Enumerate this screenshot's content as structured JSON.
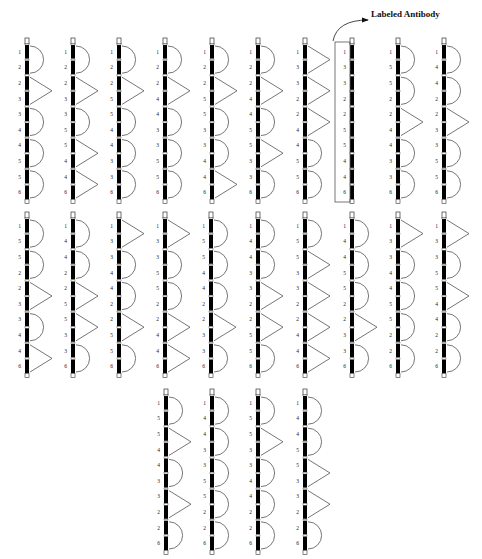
{
  "annotation": {
    "label": "Labeled Antibody",
    "x": 371,
    "y": 15,
    "arrow_from": [
      333,
      41
    ],
    "arrow_to": [
      368,
      20
    ]
  },
  "style": {
    "strip_color": "#000000",
    "strip_border": "#333333",
    "shape_color": "#666666",
    "text_color": "#222222",
    "bracket_color": "#555555"
  },
  "geometry": {
    "segment_height": 15.6,
    "cap_height": 6,
    "strip_width": 4,
    "arc_radius_factor": 1.0,
    "tri_width": 22
  },
  "rows": [
    {
      "top": 38,
      "strips": [
        {
          "x": 27,
          "numbers": [
            1,
            2,
            2,
            3,
            3,
            4,
            4,
            5,
            5,
            6
          ],
          "domains": [
            "arc",
            "tri",
            "arc",
            "arc",
            "arc"
          ]
        },
        {
          "x": 73,
          "numbers": [
            1,
            2,
            2,
            3,
            3,
            5,
            5,
            4,
            4,
            6
          ],
          "domains": [
            "arc",
            "tri",
            "arc",
            "tri",
            "tri"
          ]
        },
        {
          "x": 119,
          "numbers": [
            1,
            2,
            2,
            5,
            5,
            4,
            4,
            3,
            3,
            6
          ],
          "domains": [
            "arc",
            "tri",
            "arc",
            "arc",
            "arc"
          ]
        },
        {
          "x": 165,
          "numbers": [
            1,
            2,
            2,
            4,
            4,
            3,
            3,
            5,
            5,
            6
          ],
          "domains": [
            "arc",
            "tri",
            "arc",
            "arc",
            "arc"
          ]
        },
        {
          "x": 212,
          "numbers": [
            1,
            2,
            2,
            5,
            5,
            3,
            3,
            4,
            4,
            6
          ],
          "domains": [
            "arc",
            "tri",
            "arc",
            "arc",
            "tri"
          ]
        },
        {
          "x": 258,
          "numbers": [
            1,
            2,
            2,
            4,
            4,
            5,
            5,
            3,
            3,
            6
          ],
          "domains": [
            "arc",
            "tri",
            "arc",
            "tri",
            "arc"
          ]
        },
        {
          "x": 305,
          "numbers": [
            1,
            3,
            3,
            2,
            2,
            4,
            4,
            5,
            5,
            6
          ],
          "domains": [
            "tri",
            "tri",
            "tri",
            "arc",
            "arc"
          ]
        },
        {
          "x": 352,
          "numbers": [
            1,
            3,
            3,
            2,
            2,
            5,
            5,
            4,
            4,
            6
          ],
          "domains": [],
          "labeled": true
        },
        {
          "x": 398,
          "numbers": [
            1,
            5,
            5,
            2,
            2,
            4,
            4,
            3,
            3,
            6
          ],
          "domains": [
            "arc",
            "arc",
            "tri",
            "arc",
            "arc"
          ]
        },
        {
          "x": 444,
          "numbers": [
            1,
            4,
            4,
            2,
            2,
            3,
            3,
            5,
            5,
            6
          ],
          "domains": [
            "arc",
            "arc",
            "tri",
            "arc",
            "arc"
          ]
        }
      ]
    },
    {
      "top": 212,
      "strips": [
        {
          "x": 27,
          "numbers": [
            1,
            5,
            5,
            2,
            2,
            3,
            3,
            4,
            4,
            6
          ],
          "domains": [
            "arc",
            "arc",
            "tri",
            "arc",
            "tri"
          ]
        },
        {
          "x": 73,
          "numbers": [
            1,
            4,
            4,
            2,
            2,
            5,
            5,
            3,
            3,
            6
          ],
          "domains": [
            "arc",
            "arc",
            "tri",
            "tri",
            "arc"
          ]
        },
        {
          "x": 119,
          "numbers": [
            1,
            3,
            3,
            4,
            4,
            2,
            2,
            5,
            5,
            6
          ],
          "domains": [
            "tri",
            "arc",
            "arc",
            "tri",
            "arc"
          ]
        },
        {
          "x": 165,
          "numbers": [
            1,
            3,
            3,
            5,
            5,
            2,
            2,
            4,
            4,
            6
          ],
          "domains": [
            "tri",
            "arc",
            "arc",
            "tri",
            "tri"
          ]
        },
        {
          "x": 211,
          "numbers": [
            1,
            5,
            5,
            4,
            4,
            2,
            2,
            3,
            3,
            6
          ],
          "domains": [
            "arc",
            "arc",
            "arc",
            "tri",
            "arc"
          ]
        },
        {
          "x": 258,
          "numbers": [
            1,
            4,
            4,
            3,
            3,
            2,
            2,
            5,
            5,
            6
          ],
          "domains": [
            "arc",
            "arc",
            "tri",
            "tri",
            "arc"
          ]
        },
        {
          "x": 305,
          "numbers": [
            1,
            5,
            5,
            3,
            3,
            2,
            2,
            4,
            4,
            6
          ],
          "domains": [
            "arc",
            "tri",
            "tri",
            "tri",
            "tri"
          ]
        },
        {
          "x": 352,
          "numbers": [
            1,
            4,
            4,
            5,
            5,
            2,
            2,
            3,
            3,
            6
          ],
          "domains": [
            "arc",
            "arc",
            "arc",
            "tri",
            "arc"
          ]
        },
        {
          "x": 398,
          "numbers": [
            1,
            3,
            3,
            4,
            4,
            5,
            5,
            2,
            2,
            6
          ],
          "domains": [
            "tri",
            "arc",
            "arc",
            "arc",
            "arc"
          ]
        },
        {
          "x": 444,
          "numbers": [
            1,
            3,
            3,
            5,
            5,
            4,
            4,
            2,
            2,
            6
          ],
          "domains": [
            "tri",
            "arc",
            "tri",
            "arc",
            "arc"
          ]
        }
      ]
    },
    {
      "top": 389,
      "strips": [
        {
          "x": 166,
          "numbers": [
            1,
            5,
            5,
            4,
            4,
            3,
            3,
            2,
            2,
            6
          ],
          "domains": [
            "arc",
            "tri",
            "arc",
            "tri",
            "arc"
          ]
        },
        {
          "x": 212,
          "numbers": [
            1,
            4,
            4,
            3,
            3,
            5,
            5,
            2,
            2,
            6
          ],
          "domains": [
            "arc",
            "arc",
            "arc",
            "arc",
            "arc"
          ]
        },
        {
          "x": 258,
          "numbers": [
            1,
            5,
            5,
            3,
            3,
            4,
            4,
            2,
            2,
            6
          ],
          "domains": [
            "arc",
            "tri",
            "arc",
            "arc",
            "arc"
          ]
        },
        {
          "x": 305,
          "numbers": [
            1,
            4,
            4,
            5,
            5,
            3,
            3,
            2,
            2,
            6
          ],
          "domains": [
            "arc",
            "arc",
            "tri",
            "tri",
            "arc"
          ]
        }
      ]
    }
  ]
}
